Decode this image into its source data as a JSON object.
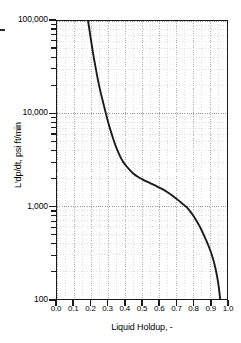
{
  "chart_data": {
    "type": "line",
    "title": "",
    "xlabel": "Liquid Holdup, -",
    "ylabel": "L'dp/dt, psi ft/min",
    "xlim": [
      0.0,
      1.0
    ],
    "ylim": [
      100,
      100000
    ],
    "yscale": "log",
    "xscale": "linear",
    "grid": true,
    "grid_style": "dotted",
    "grid_color": "#b8b8b8",
    "legend": "none",
    "line_color": "#1a1a1a",
    "frame_color": "#1a1a1a",
    "xticks": [
      0.0,
      0.1,
      0.2,
      0.3,
      0.4,
      0.5,
      0.6,
      0.7,
      0.8,
      0.9,
      1.0
    ],
    "xticklabels": [
      "0.0",
      "0.1",
      "0.2",
      "0.3",
      "0.4",
      "0.5",
      "0.6",
      "0.7",
      "0.8",
      "0.9",
      "1.0"
    ],
    "yticks": [
      100,
      1000,
      10000,
      100000
    ],
    "yticklabels": [
      "100",
      "1,000",
      "10,000",
      "100,000"
    ],
    "series": [
      {
        "name": "Liquid holdup curve",
        "x": [
          0.183,
          0.19,
          0.2,
          0.212,
          0.225,
          0.24,
          0.255,
          0.27,
          0.285,
          0.3,
          0.315,
          0.33,
          0.345,
          0.36,
          0.375,
          0.39,
          0.405,
          0.425,
          0.45,
          0.48,
          0.51,
          0.545,
          0.58,
          0.615,
          0.65,
          0.685,
          0.715,
          0.742,
          0.762,
          0.78,
          0.8,
          0.822,
          0.845,
          0.868,
          0.89,
          0.912,
          0.932,
          0.948,
          0.96
        ],
        "y": [
          100000,
          82000,
          62000,
          45000,
          33000,
          23500,
          17500,
          13500,
          10500,
          8200,
          6600,
          5400,
          4500,
          3850,
          3350,
          3000,
          2760,
          2500,
          2250,
          2060,
          1920,
          1790,
          1670,
          1550,
          1420,
          1280,
          1160,
          1050,
          980,
          900,
          800,
          690,
          580,
          470,
          380,
          295,
          215,
          150,
          100
        ]
      }
    ]
  }
}
